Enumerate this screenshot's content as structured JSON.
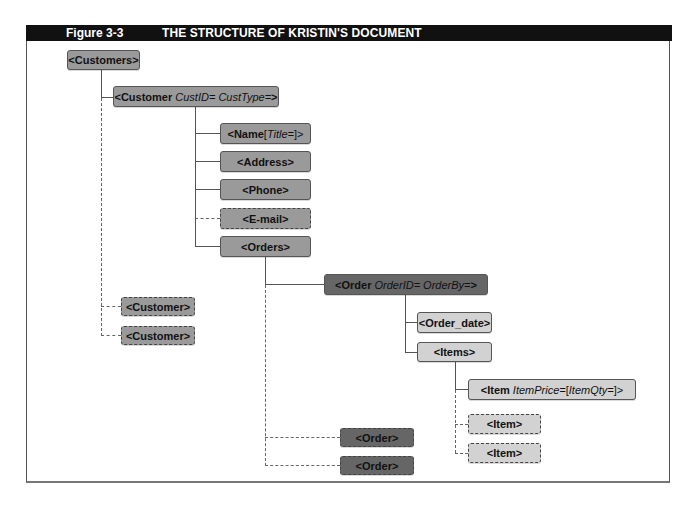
{
  "header": {
    "figure_label": "Figure 3-3",
    "title": "THE STRUCTURE OF KRISTIN'S DOCUMENT"
  },
  "nodes": {
    "customers": {
      "tag": "<Customers>"
    },
    "customer": {
      "tag": "<Customer",
      "attrs": "CustID= CustType=",
      "close": ">"
    },
    "name": {
      "tag": "<Name ",
      "attrs_open": "[",
      "attrs": "Title=",
      "attrs_close": "]>"
    },
    "address": {
      "tag": "<Address>"
    },
    "phone": {
      "tag": "<Phone>"
    },
    "email": {
      "tag": "<E-mail>"
    },
    "orders": {
      "tag": "<Orders>"
    },
    "order": {
      "tag": "<Order",
      "attrs": "OrderID= OrderBy=",
      "close": ">"
    },
    "order_date": {
      "tag": "<Order_date>"
    },
    "items": {
      "tag": "<Items>"
    },
    "item": {
      "tag": "<Item",
      "attrs": "ItemPrice=",
      "opt_open": " [",
      "opt": "ItemQty=",
      "opt_close": "]>"
    },
    "item_rep_1": {
      "tag": "<Item>"
    },
    "item_rep_2": {
      "tag": "<Item>"
    },
    "order_rep_1": {
      "tag": "<Order>"
    },
    "order_rep_2": {
      "tag": "<Order>"
    },
    "customer_rep_1": {
      "tag": "<Customer>"
    },
    "customer_rep_2": {
      "tag": "<Customer>"
    }
  },
  "colors": {
    "header_bg": "#111111",
    "level_mid": "#9a9a9a",
    "level_dark": "#666666",
    "level_light": "#d2d2d2"
  }
}
